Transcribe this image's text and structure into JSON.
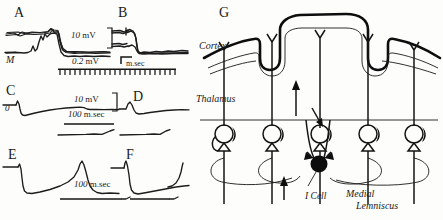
{
  "figure": {
    "domain_note": "electrophysiology figure with six recording panels and one circuit schematic",
    "panels": [
      {
        "id": "A",
        "label": "A",
        "trace_label": "M"
      },
      {
        "id": "B",
        "label": "B"
      },
      {
        "id": "C",
        "label": "C",
        "trace_label": "0"
      },
      {
        "id": "D",
        "label": "D"
      },
      {
        "id": "E",
        "label": "E"
      },
      {
        "id": "F",
        "label": "F"
      },
      {
        "id": "G",
        "label": "G"
      }
    ],
    "scale_bars": [
      {
        "id": "ab-voltage-high",
        "value": "10",
        "unit": "mV"
      },
      {
        "id": "ab-voltage-low",
        "value": "0.2",
        "unit": "mV"
      },
      {
        "id": "ab-time",
        "value": "",
        "unit": "m.sec"
      },
      {
        "id": "cd-voltage",
        "value": "10",
        "unit": "mV"
      },
      {
        "id": "cd-time",
        "value": "100",
        "unit": "m.sec"
      },
      {
        "id": "ef-time",
        "value": "100",
        "unit": "m.sec"
      }
    ],
    "diagram": {
      "title_letter": "G",
      "regions": [
        {
          "name": "cortex-label",
          "text": "Cortex"
        },
        {
          "name": "thalamus-label",
          "text": "Thalamus"
        }
      ],
      "cell_label": "I Cell",
      "pathway_label_line1": "Medial",
      "pathway_label_line2": "Lemniscus"
    },
    "colors": {
      "ink": "#141414",
      "paper": "#fdfdfb",
      "trace": "#1c1c1c"
    }
  }
}
